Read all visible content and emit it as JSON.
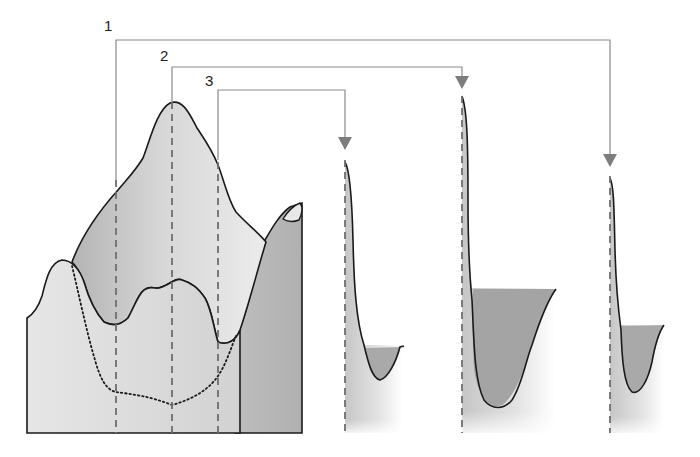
{
  "diagram": {
    "type": "schematic cross-section with projection lines",
    "labels": [
      {
        "id": "1",
        "text": "1",
        "x": 104,
        "y": 18
      },
      {
        "id": "2",
        "text": "2",
        "x": 160,
        "y": 48
      },
      {
        "id": "3",
        "text": "3",
        "x": 205,
        "y": 73
      }
    ],
    "sample_lines": [
      {
        "id": "1",
        "x": 116,
        "bracket_y": 40,
        "target_x": 610
      },
      {
        "id": "2",
        "x": 172,
        "bracket_y": 67,
        "target_x": 462
      },
      {
        "id": "3",
        "x": 218,
        "bracket_y": 90,
        "target_x": 345
      }
    ],
    "profiles": [
      {
        "id": "profile-3",
        "x": 345,
        "arrow_y": 142
      },
      {
        "id": "profile-2",
        "x": 462,
        "arrow_y": 80
      },
      {
        "id": "profile-1",
        "x": 610,
        "arrow_y": 158
      }
    ],
    "colors": {
      "light_fill": "#e2e2e2",
      "mid_fill": "#c9c9c9",
      "dark_fill": "#a9a9a9",
      "outline": "#1a1a1a",
      "guide_line": "#8a8a8a",
      "arrow": "#7d7d7d",
      "dash": "#6e6e6e"
    }
  }
}
